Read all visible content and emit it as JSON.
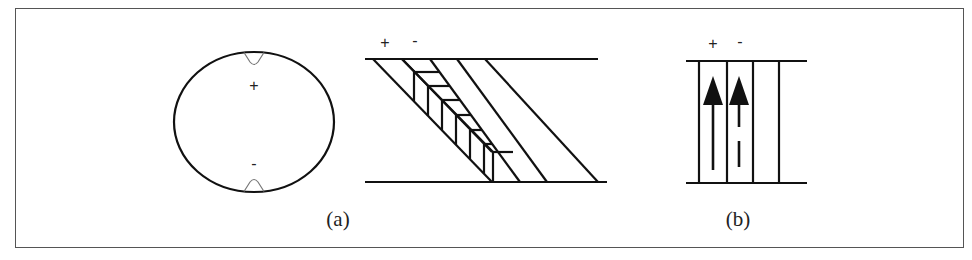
{
  "figure": {
    "frame_color": "#555555",
    "stroke_color": "#111111",
    "notch_color": "#777777",
    "panels": [
      {
        "id": "a",
        "caption": "(a)",
        "parts": [
          {
            "name": "circular-cross-section",
            "top_sign": "+",
            "bottom_sign": "-"
          },
          {
            "name": "slanted-layer-diagram",
            "top_signs": [
              "+",
              "-"
            ]
          }
        ]
      },
      {
        "id": "b",
        "caption": "(b)",
        "parts": [
          {
            "name": "vertical-channel-diagram",
            "top_signs": [
              "+",
              "-"
            ],
            "arrows": [
              "solid-up-arrow",
              "dashed-up-arrow"
            ]
          }
        ]
      }
    ]
  }
}
